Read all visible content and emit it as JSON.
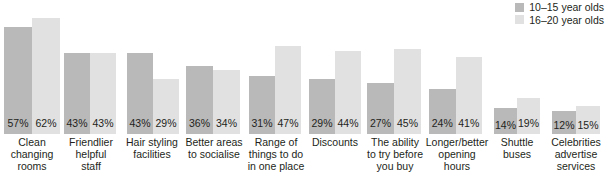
{
  "chart": {
    "legend": {
      "position": "top-right",
      "entries": [
        {
          "label": "10–15 year olds",
          "color": "#b9b9b9",
          "icon": "legend-swatch-icon"
        },
        {
          "label": "16–20 year olds",
          "color": "#e1e1e1",
          "icon": "legend-swatch-icon"
        }
      ]
    }
  },
  "chart_data": {
    "type": "bar",
    "title": "",
    "xlabel": "",
    "ylabel": "",
    "ylim": [
      0,
      70
    ],
    "grid": false,
    "legend_position": "top-right",
    "value_suffix": "%",
    "categories": [
      "Clean changing rooms",
      "Friendlier helpful staff",
      "Hair styling facilities",
      "Better areas to socialise",
      "Range of things to do in one place",
      "Discounts",
      "The ability to try before you buy",
      "Longer/better opening hours",
      "Shuttle buses",
      "Celebrities advertise services"
    ],
    "category_lines": [
      [
        "Clean",
        "changing",
        "rooms"
      ],
      [
        "Friendlier",
        "helpful",
        "staff"
      ],
      [
        "Hair styling",
        "facilities"
      ],
      [
        "Better areas",
        "to socialise"
      ],
      [
        "Range of",
        "things to do",
        "in one place"
      ],
      [
        "Discounts"
      ],
      [
        "The ability",
        "to try before",
        "you buy"
      ],
      [
        "Longer/better",
        "opening",
        "hours"
      ],
      [
        "Shuttle",
        "buses"
      ],
      [
        "Celebrities",
        "advertise",
        "services"
      ]
    ],
    "series": [
      {
        "name": "10–15 year olds",
        "color": "#b9b9b9",
        "values": [
          57,
          43,
          43,
          36,
          31,
          29,
          27,
          24,
          14,
          12
        ],
        "labels": [
          "57%",
          "43%",
          "43%",
          "36%",
          "31%",
          "29%",
          "27%",
          "24%",
          "14%",
          "12%"
        ]
      },
      {
        "name": "16–20 year olds",
        "color": "#e1e1e1",
        "values": [
          62,
          43,
          29,
          34,
          47,
          44,
          45,
          41,
          19,
          15
        ],
        "labels": [
          "62%",
          "43%",
          "29%",
          "34%",
          "47%",
          "44%",
          "45%",
          "41%",
          "19%",
          "15%"
        ]
      }
    ]
  },
  "layout": {
    "groups": [
      {
        "left": 4,
        "width": 56
      },
      {
        "left": 64,
        "width": 52
      },
      {
        "left": 127,
        "width": 52
      },
      {
        "left": 186,
        "width": 54
      },
      {
        "left": 249,
        "width": 52
      },
      {
        "left": 309,
        "width": 52
      },
      {
        "left": 367,
        "width": 54
      },
      {
        "left": 429,
        "width": 53
      },
      {
        "left": 494,
        "width": 46
      },
      {
        "left": 552,
        "width": 48
      }
    ],
    "cats": [
      {
        "left": 2,
        "width": 60
      },
      {
        "left": 62,
        "width": 58
      },
      {
        "left": 120,
        "width": 64
      },
      {
        "left": 182,
        "width": 64
      },
      {
        "left": 244,
        "width": 64
      },
      {
        "left": 306,
        "width": 58
      },
      {
        "left": 362,
        "width": 66
      },
      {
        "left": 424,
        "width": 66
      },
      {
        "left": 490,
        "width": 54
      },
      {
        "left": 546,
        "width": 60
      }
    ]
  }
}
